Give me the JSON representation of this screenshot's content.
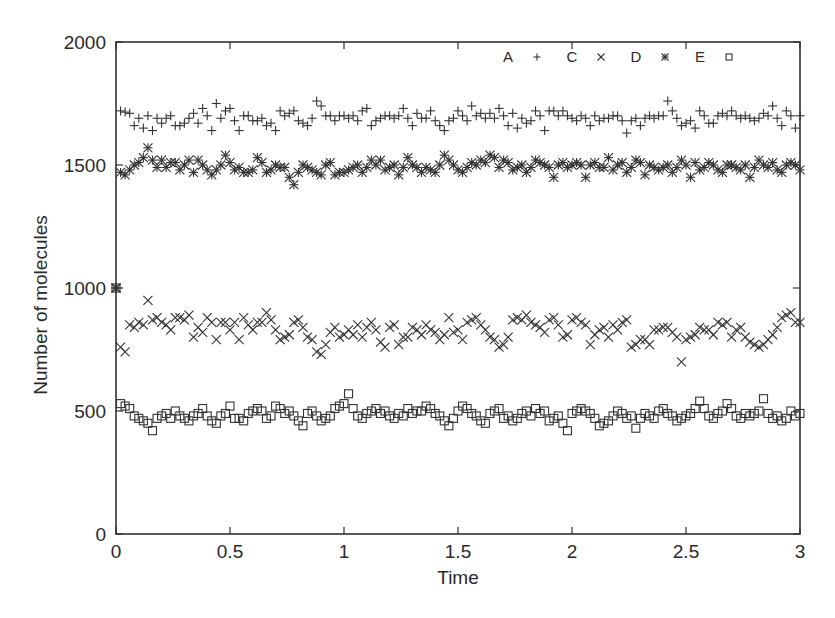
{
  "chart_data": {
    "type": "scatter",
    "title": "",
    "xlabel": "Time",
    "ylabel": "Number of molecules",
    "xlim": [
      0,
      3
    ],
    "ylim": [
      0,
      2000
    ],
    "xticks": [
      0,
      0.5,
      1,
      1.5,
      2,
      2.5,
      3
    ],
    "xtick_labels": [
      "0",
      "0.5",
      "1",
      "1.5",
      "2",
      "2.5",
      "3"
    ],
    "yticks": [
      0,
      500,
      1000,
      1500,
      2000
    ],
    "ytick_labels": [
      "0",
      "500",
      "1000",
      "1500",
      "2000"
    ],
    "grid": false,
    "legend_position": "top-right",
    "legend": [
      {
        "label": "A",
        "marker": "+"
      },
      {
        "label": "C",
        "marker": "×"
      },
      {
        "label": "D",
        "marker": "*"
      },
      {
        "label": "E",
        "marker": "□"
      }
    ],
    "x_step": 0.02,
    "initial_value_all_series": 1000,
    "series": [
      {
        "name": "A",
        "marker": "plus",
        "values": [
          1720,
          1715,
          1710,
          1660,
          1690,
          1650,
          1700,
          1640,
          1690,
          1670,
          1690,
          1700,
          1660,
          1660,
          1670,
          1690,
          1710,
          1670,
          1730,
          1700,
          1640,
          1750,
          1690,
          1720,
          1730,
          1680,
          1640,
          1700,
          1700,
          1680,
          1680,
          1690,
          1660,
          1670,
          1640,
          1720,
          1700,
          1710,
          1720,
          1680,
          1670,
          1660,
          1690,
          1760,
          1740,
          1700,
          1700,
          1680,
          1700,
          1700,
          1690,
          1700,
          1680,
          1720,
          1730,
          1660,
          1680,
          1690,
          1700,
          1700,
          1690,
          1700,
          1730,
          1690,
          1660,
          1710,
          1690,
          1690,
          1720,
          1680,
          1660,
          1640,
          1680,
          1690,
          1720,
          1700,
          1680,
          1740,
          1700,
          1710,
          1690,
          1710,
          1690,
          1730,
          1700,
          1660,
          1710,
          1650,
          1690,
          1670,
          1680,
          1720,
          1700,
          1640,
          1720,
          1720,
          1700,
          1720,
          1700,
          1690,
          1680,
          1700,
          1690,
          1660,
          1700,
          1680,
          1690,
          1690,
          1700,
          1700,
          1680,
          1630,
          1680,
          1690,
          1660,
          1690,
          1700,
          1690,
          1700,
          1700,
          1760,
          1720,
          1690,
          1660,
          1670,
          1680,
          1650,
          1720,
          1700,
          1670,
          1670,
          1700,
          1710,
          1700,
          1720,
          1700,
          1690,
          1700,
          1690,
          1680,
          1690,
          1710,
          1700,
          1740,
          1690,
          1660,
          1720,
          1700,
          1650,
          1700,
          1720,
          1710,
          1690,
          1660,
          1620
        ]
      },
      {
        "name": "C",
        "marker": "cross",
        "values": [
          760,
          740,
          850,
          840,
          860,
          850,
          950,
          870,
          880,
          860,
          850,
          830,
          880,
          880,
          870,
          890,
          800,
          840,
          820,
          880,
          860,
          790,
          860,
          860,
          830,
          860,
          790,
          880,
          850,
          830,
          860,
          860,
          900,
          870,
          830,
          790,
          800,
          810,
          860,
          870,
          840,
          800,
          790,
          740,
          730,
          770,
          820,
          840,
          800,
          810,
          830,
          810,
          850,
          800,
          840,
          860,
          830,
          780,
          760,
          840,
          850,
          770,
          800,
          800,
          840,
          830,
          810,
          850,
          830,
          820,
          790,
          810,
          880,
          820,
          830,
          790,
          860,
          870,
          880,
          850,
          830,
          800,
          790,
          760,
          770,
          800,
          870,
          880,
          870,
          890,
          860,
          850,
          840,
          820,
          870,
          880,
          850,
          800,
          810,
          870,
          880,
          860,
          850,
          770,
          810,
          830,
          840,
          800,
          850,
          830,
          860,
          870,
          760,
          770,
          790,
          790,
          770,
          830,
          830,
          840,
          840,
          820,
          800,
          700,
          790,
          800,
          810,
          840,
          830,
          830,
          810,
          860,
          850,
          860,
          800,
          830,
          840,
          800,
          780,
          770,
          760,
          770,
          790,
          810,
          840,
          880,
          890,
          900,
          860,
          860,
          850,
          880,
          870,
          860,
          900
        ]
      },
      {
        "name": "D",
        "marker": "star",
        "values": [
          1470,
          1460,
          1480,
          1500,
          1510,
          1530,
          1570,
          1520,
          1490,
          1520,
          1490,
          1510,
          1510,
          1480,
          1500,
          1520,
          1470,
          1520,
          1500,
          1480,
          1460,
          1480,
          1500,
          1540,
          1510,
          1480,
          1490,
          1470,
          1470,
          1480,
          1530,
          1510,
          1470,
          1480,
          1500,
          1490,
          1490,
          1450,
          1420,
          1470,
          1500,
          1490,
          1480,
          1470,
          1460,
          1500,
          1510,
          1460,
          1470,
          1470,
          1480,
          1490,
          1500,
          1470,
          1490,
          1520,
          1500,
          1520,
          1480,
          1490,
          1500,
          1460,
          1490,
          1530,
          1500,
          1490,
          1470,
          1490,
          1480,
          1470,
          1500,
          1540,
          1520,
          1500,
          1480,
          1470,
          1490,
          1510,
          1500,
          1520,
          1510,
          1540,
          1530,
          1490,
          1520,
          1510,
          1480,
          1490,
          1500,
          1470,
          1490,
          1520,
          1510,
          1500,
          1490,
          1450,
          1500,
          1510,
          1490,
          1500,
          1510,
          1500,
          1450,
          1500,
          1510,
          1490,
          1490,
          1530,
          1480,
          1500,
          1510,
          1470,
          1490,
          1520,
          1510,
          1460,
          1500,
          1490,
          1480,
          1490,
          1500,
          1470,
          1490,
          1520,
          1500,
          1450,
          1510,
          1480,
          1490,
          1510,
          1500,
          1480,
          1470,
          1500,
          1500,
          1490,
          1480,
          1500,
          1450,
          1490,
          1520,
          1500,
          1490,
          1510,
          1480,
          1470,
          1500,
          1510,
          1500,
          1480,
          1490,
          1500
        ]
      },
      {
        "name": "E",
        "marker": "square",
        "values": [
          530,
          520,
          510,
          480,
          470,
          460,
          450,
          420,
          470,
          480,
          490,
          470,
          500,
          480,
          470,
          460,
          480,
          490,
          510,
          480,
          460,
          450,
          480,
          490,
          520,
          470,
          470,
          460,
          490,
          500,
          510,
          500,
          470,
          480,
          520,
          510,
          490,
          500,
          480,
          460,
          440,
          490,
          500,
          480,
          460,
          470,
          480,
          510,
          520,
          530,
          570,
          510,
          480,
          470,
          490,
          500,
          510,
          490,
          500,
          480,
          470,
          490,
          480,
          510,
          490,
          500,
          500,
          520,
          510,
          490,
          480,
          460,
          440,
          470,
          500,
          520,
          510,
          490,
          480,
          460,
          450,
          490,
          500,
          510,
          470,
          480,
          460,
          470,
          490,
          500,
          480,
          510,
          490,
          500,
          460,
          470,
          480,
          450,
          420,
          490,
          500,
          510,
          500,
          490,
          470,
          440,
          450,
          460,
          480,
          500,
          490,
          470,
          480,
          430,
          470,
          490,
          480,
          470,
          500,
          510,
          490,
          480,
          460,
          470,
          480,
          490,
          510,
          540,
          510,
          480,
          470,
          490,
          500,
          530,
          510,
          480,
          470,
          490,
          480,
          490,
          500,
          550,
          490,
          470,
          480,
          460,
          470,
          500,
          480,
          490,
          460,
          470,
          480,
          490,
          500
        ]
      }
    ]
  }
}
